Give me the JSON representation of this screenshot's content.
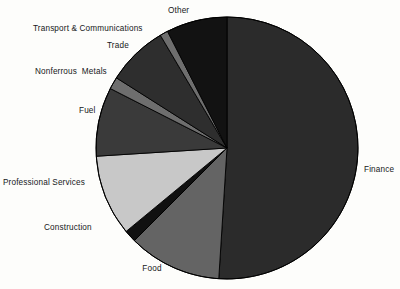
{
  "chart_data": {
    "type": "pie",
    "title": "",
    "subtitle": "",
    "xlabel": "",
    "ylabel": "",
    "legend_position": "none",
    "grid": false,
    "labels_outside": true,
    "start_angle_deg": 0,
    "direction": "clockwise",
    "categories": [
      "Finance",
      "Food",
      "Construction",
      "Professional Services",
      "Fuel",
      "Nonferrous  Metals",
      "Trade",
      "Transport & Communications",
      "Other"
    ],
    "values": [
      51.0,
      11.5,
      1.5,
      10.0,
      8.5,
      1.5,
      7.5,
      1.0,
      7.5
    ],
    "slices": [
      {
        "label": "Finance",
        "value": 51.0,
        "start_deg": 0,
        "end_deg": 183.6,
        "color": "#2b2b2b",
        "label_x": 364,
        "label_y": 165,
        "label_align": "left"
      },
      {
        "label": "Food",
        "value": 11.5,
        "start_deg": 183.6,
        "end_deg": 225.0,
        "color": "#646464",
        "label_x": 152,
        "label_y": 270,
        "label_align": "center"
      },
      {
        "label": "Construction",
        "value": 1.5,
        "start_deg": 225.0,
        "end_deg": 230.4,
        "color": "#101010",
        "label_x": 44,
        "label_y": 224,
        "label_align": "left"
      },
      {
        "label": "Professional Services",
        "value": 10.0,
        "start_deg": 230.4,
        "end_deg": 266.4,
        "color": "#c8c8c8",
        "label_x": 3,
        "label_y": 180,
        "label_align": "left"
      },
      {
        "label": "Fuel",
        "value": 8.5,
        "start_deg": 266.4,
        "end_deg": 297.0,
        "color": "#3a3a3a",
        "label_x": 79,
        "label_y": 107,
        "label_align": "left"
      },
      {
        "label": "Nonferrous  Metals",
        "value": 1.5,
        "start_deg": 297.0,
        "end_deg": 302.4,
        "color": "#6e6e6e",
        "label_x": 36,
        "label_y": 68,
        "label_align": "left"
      },
      {
        "label": "Trade",
        "value": 7.5,
        "start_deg": 302.4,
        "end_deg": 329.4,
        "color": "#2e2e2e",
        "label_x": 107,
        "label_y": 41,
        "label_align": "left"
      },
      {
        "label": "Transport & Communications",
        "value": 1.0,
        "start_deg": 329.4,
        "end_deg": 333.0,
        "color": "#6e6e6e",
        "label_x": 34,
        "label_y": 24,
        "label_align": "left"
      },
      {
        "label": "Other",
        "value": 7.5,
        "start_deg": 333.0,
        "end_deg": 360.0,
        "color": "#121212",
        "label_x": 170,
        "label_y": 6,
        "label_align": "left"
      }
    ],
    "geometry": {
      "cx": 227,
      "cy": 148,
      "r": 131
    },
    "colors": {
      "background": "#fdfdfb",
      "text": "#16181a",
      "outline": "#000000"
    }
  }
}
